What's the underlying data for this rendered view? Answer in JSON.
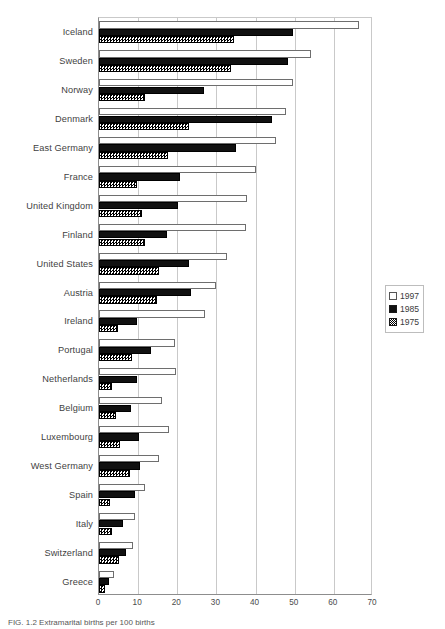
{
  "caption": "FIG. 1.2   Extramarital births per 100 births",
  "legend": {
    "position": "right",
    "items": [
      {
        "label": "1997",
        "swatch": "white-square-icon",
        "color": "#ffffff"
      },
      {
        "label": "1985",
        "swatch": "black-square-icon",
        "color": "#111111"
      },
      {
        "label": "1975",
        "swatch": "hatched-square-icon",
        "color": "#808080"
      }
    ]
  },
  "chart_data": {
    "type": "bar",
    "orientation": "horizontal",
    "title": "",
    "xlabel": "",
    "ylabel": "",
    "xlim": [
      0,
      70
    ],
    "xticks": [
      0,
      10,
      20,
      30,
      40,
      50,
      60,
      70
    ],
    "grid": true,
    "categories": [
      "Iceland",
      "Sweden",
      "Norway",
      "Denmark",
      "East Germany",
      "France",
      "United Kingdom",
      "Finland",
      "United States",
      "Austria",
      "Ireland",
      "Portugal",
      "Netherlands",
      "Belgium",
      "Luxembourg",
      "West Germany",
      "Spain",
      "Italy",
      "Switzerland",
      "Greece"
    ],
    "series": [
      {
        "name": "1997",
        "color": "#ffffff",
        "values": [
          66.5,
          54.2,
          49.5,
          47.8,
          45.2,
          40.1,
          37.8,
          37.6,
          32.8,
          29.8,
          27.2,
          19.3,
          19.6,
          16.0,
          17.8,
          15.3,
          11.7,
          9.1,
          8.6,
          3.8
        ]
      },
      {
        "name": "1985",
        "color": "#111111",
        "values": [
          49.6,
          48.4,
          26.7,
          44.3,
          35.0,
          20.6,
          20.1,
          17.3,
          22.9,
          23.4,
          9.8,
          13.3,
          9.6,
          8.2,
          10.1,
          10.6,
          9.2,
          6.1,
          6.9,
          2.6
        ]
      },
      {
        "name": "1975",
        "color": "#808080",
        "values": [
          34.4,
          33.8,
          11.7,
          23.1,
          17.7,
          9.8,
          11.1,
          11.7,
          15.3,
          14.7,
          4.8,
          8.5,
          3.2,
          4.3,
          5.3,
          7.8,
          2.8,
          3.3,
          5.1,
          1.5
        ]
      }
    ]
  }
}
